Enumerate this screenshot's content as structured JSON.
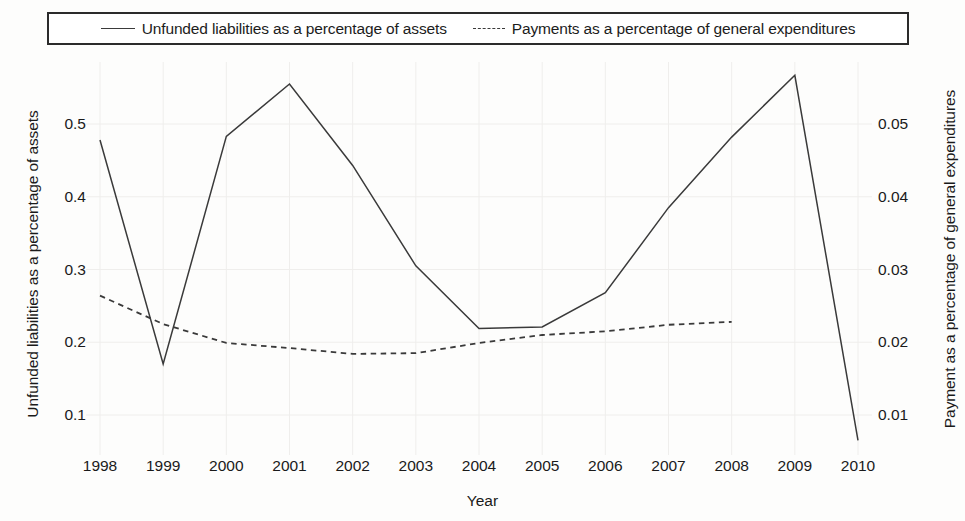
{
  "legend": {
    "entries": [
      {
        "label": "Unfunded liabilities as a percentage of assets",
        "style": "solid",
        "icon": "solid-line-icon"
      },
      {
        "label": "Payments as a percentage of general expenditures",
        "style": "dashed",
        "icon": "dashed-line-icon"
      }
    ]
  },
  "axes": {
    "x_title": "Year",
    "y_left_title": "Unfunded liabilities as a percentage of assets",
    "y_right_title": "Payment as a percentage of general expenditures"
  },
  "colors": {
    "line": "#3a3a3a",
    "text": "#1a1a1a",
    "grid": "#efeeec",
    "legend_border": "#2b2b2b",
    "background": "#fdfdfc"
  },
  "chart_data": {
    "type": "line",
    "title": "",
    "xlabel": "Year",
    "ylabel": "Unfunded liabilities as a percentage of assets",
    "y2label": "Payment as a percentage of general expenditures",
    "x": [
      1998,
      1999,
      2000,
      2001,
      2002,
      2003,
      2004,
      2005,
      2006,
      2007,
      2008,
      2009,
      2010
    ],
    "xticklabels": [
      "1998",
      "1999",
      "2000",
      "2001",
      "2002",
      "2003",
      "2004",
      "2005",
      "2006",
      "2007",
      "2008",
      "2009",
      "2010"
    ],
    "xlim": [
      1998,
      2010
    ],
    "ylim": [
      0.0,
      0.6
    ],
    "yticks": [
      0.1,
      0.2,
      0.3,
      0.4,
      0.5
    ],
    "yticklabels": [
      "0.1",
      "0.2",
      "0.3",
      "0.4",
      "0.5"
    ],
    "y2lim": [
      0.0,
      0.06
    ],
    "y2ticks": [
      0.01,
      0.02,
      0.03,
      0.04,
      0.05
    ],
    "y2ticklabels": [
      "0.01",
      "0.02",
      "0.03",
      "0.04",
      "0.05"
    ],
    "grid": true,
    "legend_position": "top",
    "series": [
      {
        "name": "Unfunded liabilities as a percentage of assets",
        "axis": "left",
        "linestyle": "solid",
        "color": "#3a3a3a",
        "x": [
          1998,
          1999,
          2000,
          2001,
          2002,
          2003,
          2004,
          2005,
          2006,
          2007,
          2008,
          2009,
          2010
        ],
        "values": [
          0.478,
          0.17,
          0.483,
          0.555,
          0.443,
          0.305,
          0.219,
          0.221,
          0.268,
          0.385,
          0.482,
          0.567,
          0.065
        ]
      },
      {
        "name": "Payments as a percentage of general expenditures",
        "axis": "right",
        "linestyle": "dashed",
        "color": "#3a3a3a",
        "x": [
          1998,
          1999,
          2000,
          2001,
          2002,
          2003,
          2004,
          2005,
          2006,
          2007,
          2008
        ],
        "values": [
          0.0264,
          0.0225,
          0.0199,
          0.0192,
          0.0184,
          0.0185,
          0.0199,
          0.021,
          0.0215,
          0.0224,
          0.0228
        ]
      }
    ]
  }
}
